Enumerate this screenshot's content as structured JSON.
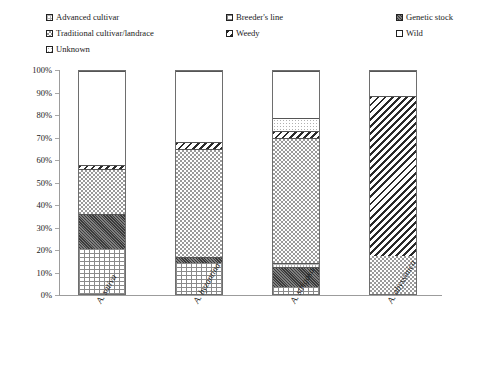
{
  "legend": {
    "rows": [
      [
        {
          "label": "Advanced cultivar",
          "pattern": "advanced"
        },
        {
          "label": "Breeder's line",
          "pattern": "breeder"
        },
        {
          "label": "Genetic stock",
          "pattern": "genetic"
        }
      ],
      [
        {
          "label": "Traditional cultivar/landrace",
          "pattern": "traditional"
        },
        {
          "label": "Weedy",
          "pattern": "weedy"
        },
        {
          "label": "Wild",
          "pattern": "wild"
        }
      ],
      [
        {
          "label": "Unknown",
          "pattern": "unknown"
        }
      ]
    ]
  },
  "axis": {
    "yticks": [
      "100%",
      "90%",
      "80%",
      "70%",
      "60%",
      "50%",
      "40%",
      "30%",
      "20%",
      "10%",
      "0%"
    ],
    "ymin": 0,
    "ymax": 100
  },
  "chart_data": {
    "type": "bar",
    "subtype": "stacked-bar-100-percent",
    "title": "",
    "xlabel": "",
    "ylabel": "",
    "ylim": [
      0,
      100
    ],
    "grid": false,
    "legend_position": "top",
    "categories": [
      "A. sativa",
      "A. byzantina",
      "A. strigosa",
      "A. abyssinica"
    ],
    "series": [
      {
        "name": "Breeder's line",
        "pattern": "breeder",
        "values": [
          20.0,
          14.0,
          3.0,
          0.0
        ]
      },
      {
        "name": "Genetic stock",
        "pattern": "genetic",
        "values": [
          16.0,
          2.5,
          9.0,
          0.0
        ]
      },
      {
        "name": "Advanced cultivar",
        "pattern": "advanced",
        "values": [
          0.0,
          0.0,
          2.0,
          0.0
        ]
      },
      {
        "name": "Traditional cultivar/landrace",
        "pattern": "traditional",
        "values": [
          20.0,
          48.5,
          56.0,
          17.0
        ]
      },
      {
        "name": "Weedy",
        "pattern": "weedy",
        "values": [
          2.0,
          3.0,
          3.0,
          72.0
        ]
      },
      {
        "name": "Unknown",
        "pattern": "unknown",
        "values": [
          0.0,
          0.0,
          6.0,
          0.0
        ]
      },
      {
        "name": "Wild",
        "pattern": "wild",
        "values": [
          42.0,
          32.0,
          21.0,
          11.0
        ]
      }
    ]
  }
}
